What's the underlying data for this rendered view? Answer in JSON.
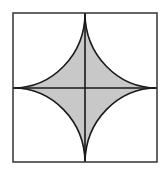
{
  "figure": {
    "square": {
      "x": 13,
      "y": 13,
      "width": 144,
      "height": 149
    },
    "center": {
      "x": 85,
      "y": 88
    },
    "colors": {
      "background": "#ffffff",
      "stroke": "#1a1a1a",
      "border": "#333333",
      "fill": "#c8c8c8"
    }
  }
}
